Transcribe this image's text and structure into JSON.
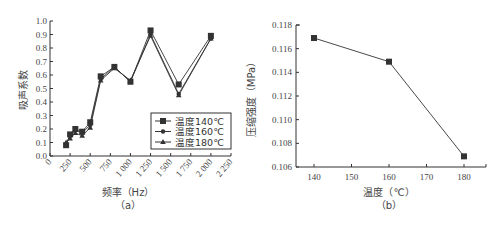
{
  "chart_data": [
    {
      "id": "a",
      "type": "line",
      "caption": "（a）",
      "xlabel": "频率（Hz）",
      "ylabel": "吸声系数",
      "xlim": [
        0,
        2250
      ],
      "ylim": [
        0.0,
        1.0
      ],
      "x_ticks": [
        "0",
        "250",
        "500",
        "750",
        "1 000",
        "1 250",
        "1 500",
        "1 750",
        "2 000",
        "2 250"
      ],
      "y_ticks": [
        "0.0",
        "0.1",
        "0.2",
        "0.3",
        "0.4",
        "0.5",
        "0.6",
        "0.7",
        "0.8",
        "0.9",
        "1.0"
      ],
      "legend_position": "lower right",
      "grid": false,
      "x": [
        200,
        250,
        315,
        400,
        500,
        630,
        800,
        1000,
        1250,
        1600,
        2000
      ],
      "series": [
        {
          "name": "温度140℃",
          "marker": "square",
          "values": [
            0.08,
            0.16,
            0.2,
            0.18,
            0.25,
            0.59,
            0.66,
            0.55,
            0.93,
            0.53,
            0.89
          ]
        },
        {
          "name": "温度160℃",
          "marker": "circle",
          "values": [
            0.09,
            0.15,
            0.19,
            0.17,
            0.23,
            0.57,
            0.66,
            0.55,
            0.9,
            0.46,
            0.87
          ]
        },
        {
          "name": "温度180℃",
          "marker": "triangle",
          "values": [
            0.1,
            0.13,
            0.17,
            0.15,
            0.21,
            0.56,
            0.65,
            0.56,
            0.89,
            0.45,
            0.87
          ]
        }
      ]
    },
    {
      "id": "b",
      "type": "line",
      "caption": "（b）",
      "xlabel": "温度（℃）",
      "ylabel": "压缩强度（MPa）",
      "xlim": [
        135,
        185
      ],
      "ylim": [
        0.106,
        0.118
      ],
      "x_ticks": [
        "140",
        "150",
        "160",
        "170",
        "180"
      ],
      "y_ticks": [
        "0.106",
        "0.108",
        "0.110",
        "0.112",
        "0.114",
        "0.116",
        "0.118"
      ],
      "grid": false,
      "x": [
        140,
        160,
        180
      ],
      "series": [
        {
          "name": "压缩强度",
          "marker": "square",
          "values": [
            0.1169,
            0.1149,
            0.1069
          ]
        }
      ]
    }
  ],
  "icons": {
    "series_markers": [
      "square-marker-icon",
      "circle-marker-icon",
      "triangle-marker-icon"
    ]
  },
  "colors": {
    "line": "#333333",
    "axis": "#333333",
    "text": "#444444",
    "background": "#ffffff"
  }
}
